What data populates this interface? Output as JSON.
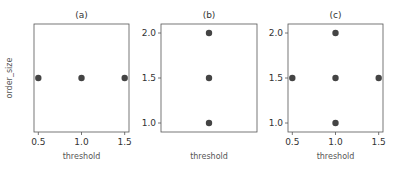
{
  "chart_data": [
    {
      "type": "scatter",
      "title": "(a)",
      "xlabel": "threshold",
      "ylabel": "order_size",
      "xlim": [
        0.45,
        1.55
      ],
      "ylim": [
        0.9,
        2.1
      ],
      "xticks": [
        "0.5",
        "1.0",
        "1.5"
      ],
      "yticks": [],
      "points": [
        {
          "x": 0.5,
          "y": 1.5
        },
        {
          "x": 1.0,
          "y": 1.5
        },
        {
          "x": 1.5,
          "y": 1.5
        }
      ],
      "grid": false
    },
    {
      "type": "scatter",
      "title": "(b)",
      "xlabel": "threshold",
      "ylabel": "",
      "xlim": [
        0.45,
        1.55
      ],
      "ylim": [
        0.9,
        2.1
      ],
      "xticks": [],
      "yticks": [
        "1.0",
        "1.5",
        "2.0"
      ],
      "points": [
        {
          "x": 1.0,
          "y": 1.0
        },
        {
          "x": 1.0,
          "y": 1.5
        },
        {
          "x": 1.0,
          "y": 2.0
        }
      ],
      "grid": false
    },
    {
      "type": "scatter",
      "title": "(c)",
      "xlabel": "threshold",
      "ylabel": "",
      "xlim": [
        0.45,
        1.55
      ],
      "ylim": [
        0.9,
        2.1
      ],
      "xticks": [
        "0.5",
        "1.0",
        "1.5"
      ],
      "yticks": [
        "1.0",
        "1.5",
        "2.0"
      ],
      "points": [
        {
          "x": 0.5,
          "y": 1.5
        },
        {
          "x": 1.0,
          "y": 1.0
        },
        {
          "x": 1.0,
          "y": 1.5
        },
        {
          "x": 1.0,
          "y": 2.0
        },
        {
          "x": 1.5,
          "y": 1.5
        }
      ],
      "grid": false
    }
  ],
  "colors": {
    "marker": "#444444",
    "frame": "#555555",
    "text": "#333333"
  }
}
